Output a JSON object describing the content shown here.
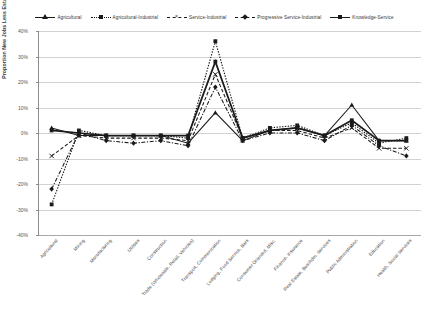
{
  "chart_data": {
    "type": "line",
    "title": "",
    "xlabel": "",
    "ylabel": "Proportion New Jobs Less Established Jobs",
    "ylim": [
      -40,
      40
    ],
    "ytick_labels": [
      "40%",
      "30%",
      "20%",
      "10%",
      "0%",
      "-10%",
      "-20%",
      "-30%",
      "-40%"
    ],
    "ytick_values": [
      40,
      30,
      20,
      10,
      0,
      -10,
      -20,
      -30,
      -40
    ],
    "grid": true,
    "legend_position": "top",
    "categories": [
      "Agricultural",
      "Mining",
      "Manufacturing",
      "Utilities",
      "Construction",
      "Trade (Wholesale, Retail, Vehicles)",
      "Transport, Communication",
      "Lodging, Food Service, Bars",
      "Consumer Oriented, Misc.",
      "Finance, Insurance",
      "Real Estate, Bus/Adm. Services",
      "Public Administration",
      "Education",
      "Health, Social Services"
    ],
    "series": [
      {
        "name": "Agricultural",
        "marker": "triangle",
        "line": "solid",
        "values": [
          2,
          -1,
          -1,
          -1,
          -1,
          -4,
          8,
          -3,
          1,
          2,
          -1,
          11,
          -3,
          -3
        ]
      },
      {
        "name": "Agricultural-Industrial",
        "marker": "square",
        "line": "dotted",
        "values": [
          -28,
          1,
          -1,
          -1,
          -1,
          -2,
          36,
          -2,
          2,
          3,
          -1,
          4,
          -4,
          -2
        ]
      },
      {
        "name": "Service-Industrial",
        "marker": "x",
        "line": "dashed",
        "values": [
          -9,
          -1,
          -2,
          -2,
          -2,
          -3,
          23,
          -2,
          1,
          1,
          -2,
          2,
          -6,
          -6
        ]
      },
      {
        "name": "Progressive Service-Industrial",
        "marker": "diamond",
        "line": "dashdot",
        "values": [
          -22,
          0,
          -3,
          -4,
          -3,
          -5,
          18,
          -3,
          0,
          0,
          -3,
          3,
          -5,
          -9
        ]
      },
      {
        "name": "Knowledge-Service",
        "marker": "square",
        "line": "solid-thick",
        "values": [
          1,
          0,
          -1,
          -1,
          -1,
          -1,
          28,
          -2,
          1,
          2,
          -1,
          5,
          -3,
          -3
        ]
      }
    ]
  },
  "colors": {
    "series": "#1a1a1a",
    "grid": "#d2d2d2",
    "axis": "#8c8c8c",
    "text": "#3d3d3d",
    "background": "#ffffff"
  }
}
